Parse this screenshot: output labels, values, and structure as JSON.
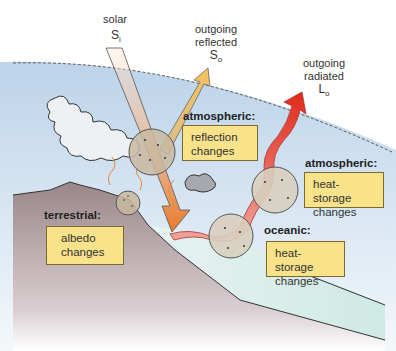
{
  "diagram": {
    "solar_input": {
      "label": "solar",
      "symbol": "S",
      "subscript": "i"
    },
    "outgoing_reflected": {
      "label_line1": "outgoing",
      "label_line2": "reflected",
      "symbol": "S",
      "subscript": "o"
    },
    "outgoing_radiated": {
      "label_line1": "outgoing",
      "label_line2": "radiated",
      "symbol": "L",
      "subscript": "o"
    },
    "boxes": [
      {
        "id": "atmospheric-reflection",
        "header": "atmospheric:",
        "line1": "reflection",
        "line2": "changes"
      },
      {
        "id": "atmospheric-heat",
        "header": "atmospheric:",
        "line1": "heat-storage",
        "line2": "changes"
      },
      {
        "id": "oceanic-heat",
        "header": "oceanic:",
        "line1": "heat-storage",
        "line2": "changes"
      },
      {
        "id": "terrestrial-albedo",
        "header": "terrestrial:",
        "line1": "albedo",
        "line2": "changes"
      }
    ],
    "colors": {
      "sky": "#cfe0ef",
      "land": "#9c8a8c",
      "ocean": "#d9eeea",
      "box_fill": "#f8e28a",
      "solar_beam": "#e8893a",
      "reflected_beam": "#f2c46a",
      "radiated_beam": "#e03a2a"
    }
  }
}
